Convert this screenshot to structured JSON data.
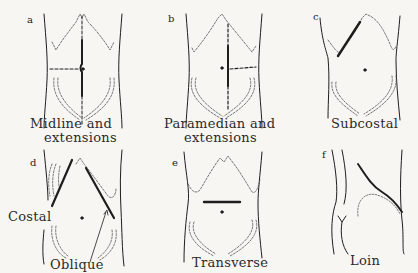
{
  "figure": {
    "panels": [
      {
        "id": "a",
        "letter": "a",
        "caption_line1": "Midline and",
        "caption_line2": "extensions"
      },
      {
        "id": "b",
        "letter": "b",
        "caption_line1": "Paramedian and",
        "caption_line2": "extensions"
      },
      {
        "id": "c",
        "letter": "c",
        "caption_line1": "Subcostal",
        "caption_line2": ""
      },
      {
        "id": "d",
        "letter": "d",
        "caption_line1": "Oblique",
        "caption_line2": "",
        "extra_label": "Costal"
      },
      {
        "id": "e",
        "letter": "e",
        "caption_line1": "Transverse",
        "caption_line2": ""
      },
      {
        "id": "f",
        "letter": "f",
        "caption_line1": "Loin",
        "caption_line2": ""
      }
    ]
  },
  "colors": {
    "background": "#f7f6f3",
    "ink": "#1e1e1e",
    "dashed": "#555555"
  }
}
